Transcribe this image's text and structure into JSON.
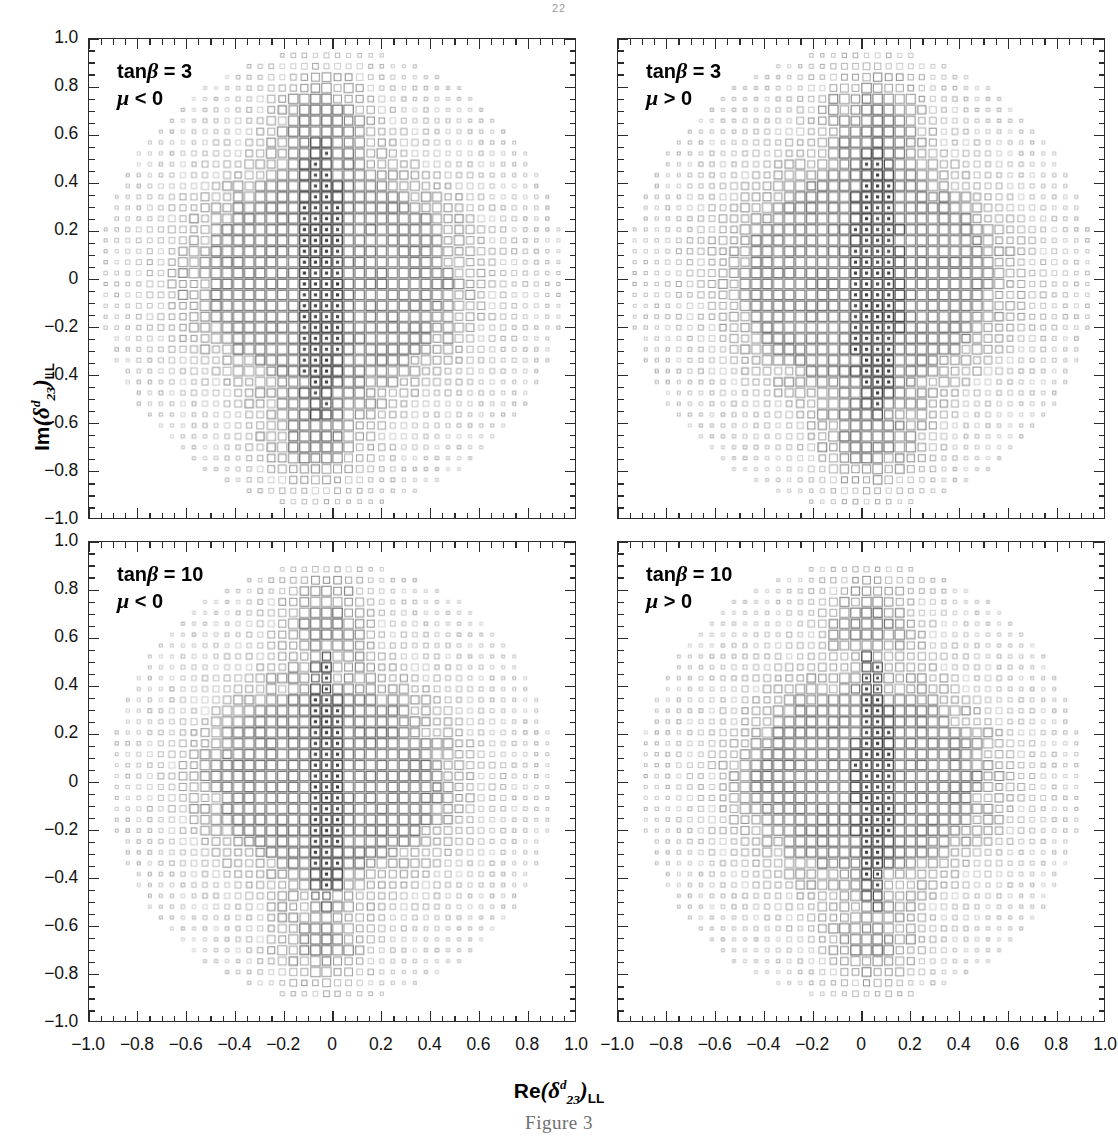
{
  "page": {
    "header": "22",
    "caption": "Figure 3"
  },
  "axes": {
    "x": {
      "label_prefix": "Re",
      "label_symbol": "δ",
      "label_sup": "d",
      "label_sub": "23",
      "label_outer_sub": "LL",
      "label_plain": "Re(δd23)LL",
      "min": -1.0,
      "max": 1.0,
      "major_step": 0.2,
      "minor_per_major": 4,
      "ticks": [
        -1.0,
        -0.8,
        -0.6,
        -0.4,
        -0.2,
        0,
        0.2,
        0.4,
        0.6,
        0.8,
        1.0
      ],
      "tick_labels": [
        "−1.0",
        "−0.8",
        "−0.6",
        "−0.4",
        "−0.2",
        "0",
        "0.2",
        "0.4",
        "0.6",
        "0.8",
        "1.0"
      ]
    },
    "y": {
      "label_prefix": "Im",
      "label_symbol": "δ",
      "label_sup": "d",
      "label_sub": "23",
      "label_outer_sub": "LL",
      "label_plain": "Im(δd23)LL",
      "min": -1.0,
      "max": 1.0,
      "major_step": 0.2,
      "minor_per_major": 4,
      "ticks": [
        1.0,
        0.8,
        0.6,
        0.4,
        0.2,
        0,
        -0.2,
        -0.4,
        -0.6,
        -0.8,
        -1.0
      ],
      "tick_labels": [
        "1.0",
        "0.8",
        "0.6",
        "0.4",
        "0.2",
        "0",
        "−0.2",
        "−0.4",
        "−0.6",
        "−0.8",
        "−1.0"
      ]
    }
  },
  "chart_data": {
    "type": "scatter",
    "title": "",
    "xlabel": "Re(δd23)LL",
    "ylabel": "Im(δd23)LL",
    "xlim": [
      -1.0,
      1.0
    ],
    "ylim": [
      -1.0,
      1.0
    ],
    "grid": false,
    "legend": "none",
    "marker_style": "open-square-box-density",
    "grid_cells": 44,
    "panels": [
      {
        "id": "top-left",
        "position": "top-left",
        "annotation_line1": "tanβ = 3",
        "annotation_line2": "μ < 0",
        "tanbeta": 3,
        "mu_sign": "negative",
        "seed": 11,
        "cloud_radius": 0.96,
        "ridge_x": -0.05,
        "ridge_sigma": 0.085,
        "ridge_strength": 1.0,
        "lobe_top": {
          "x": -0.05,
          "y": 0.7,
          "r": 0.22
        },
        "lobe_bottom": {
          "x": -0.08,
          "y": -0.7,
          "r": 0.22
        },
        "core": {
          "x": -0.05,
          "y": 0.0,
          "rx": 0.52,
          "ry": 0.4
        }
      },
      {
        "id": "top-right",
        "position": "top-right",
        "annotation_line1": "tanβ = 3",
        "annotation_line2": "μ > 0",
        "tanbeta": 3,
        "mu_sign": "positive",
        "seed": 23,
        "cloud_radius": 0.96,
        "ridge_x": 0.06,
        "ridge_sigma": 0.085,
        "ridge_strength": 1.0,
        "lobe_top": {
          "x": 0.05,
          "y": 0.7,
          "r": 0.22
        },
        "lobe_bottom": {
          "x": 0.04,
          "y": -0.7,
          "r": 0.22
        },
        "core": {
          "x": 0.06,
          "y": 0.0,
          "rx": 0.52,
          "ry": 0.4
        }
      },
      {
        "id": "bottom-left",
        "position": "bottom-left",
        "annotation_line1": "tanβ = 10",
        "annotation_line2": "μ < 0",
        "tanbeta": 10,
        "mu_sign": "negative",
        "seed": 37,
        "cloud_radius": 0.92,
        "ridge_x": -0.03,
        "ridge_sigma": 0.07,
        "ridge_strength": 0.82,
        "lobe_top": {
          "x": -0.04,
          "y": 0.7,
          "r": 0.2
        },
        "lobe_bottom": {
          "x": -0.06,
          "y": -0.7,
          "r": 0.2
        },
        "core": {
          "x": -0.04,
          "y": 0.0,
          "rx": 0.46,
          "ry": 0.3
        }
      },
      {
        "id": "bottom-right",
        "position": "bottom-right",
        "annotation_line1": "tanβ = 10",
        "annotation_line2": "μ > 0",
        "tanbeta": 10,
        "mu_sign": "positive",
        "seed": 53,
        "cloud_radius": 0.92,
        "ridge_x": 0.05,
        "ridge_sigma": 0.07,
        "ridge_strength": 0.82,
        "lobe_top": {
          "x": 0.04,
          "y": 0.7,
          "r": 0.2
        },
        "lobe_bottom": {
          "x": 0.05,
          "y": -0.7,
          "r": 0.2
        },
        "core": {
          "x": 0.05,
          "y": 0.0,
          "rx": 0.46,
          "ry": 0.3
        }
      }
    ]
  },
  "layout": {
    "panel_boxes": [
      {
        "id": "top-left",
        "left": 88,
        "top": 38,
        "width": 488,
        "height": 481
      },
      {
        "id": "top-right",
        "left": 617,
        "top": 38,
        "width": 488,
        "height": 481
      },
      {
        "id": "bottom-left",
        "left": 88,
        "top": 541,
        "width": 488,
        "height": 481
      },
      {
        "id": "bottom-right",
        "left": 617,
        "top": 541,
        "width": 488,
        "height": 481
      }
    ]
  },
  "colors": {
    "axis": "#2b2b2b",
    "text": "#141414",
    "marker_dark": "#3a3a3a",
    "marker_mid": "#8c8c8c",
    "marker_light": "#c9c9c9",
    "caption": "#6f6f6f",
    "background": "#ffffff"
  }
}
